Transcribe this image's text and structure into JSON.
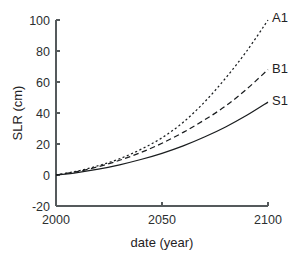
{
  "chart_data": {
    "type": "line",
    "title": "",
    "xlabel": "date (year)",
    "ylabel": "SLR (cm)",
    "xlim": [
      2000,
      2100
    ],
    "ylim": [
      -20,
      100
    ],
    "xticks": [
      2000,
      2050,
      2100
    ],
    "yticks": [
      -20,
      0,
      20,
      40,
      60,
      80,
      100
    ],
    "xtick_labels": [
      "2000",
      "2050",
      "2100"
    ],
    "ytick_labels": [
      "-20",
      "0",
      "20",
      "40",
      "60",
      "80",
      "100"
    ],
    "grid": false,
    "legend_position": "inline-right-end",
    "x": [
      2000,
      2010,
      2020,
      2030,
      2040,
      2050,
      2060,
      2070,
      2080,
      2090,
      2100
    ],
    "series": [
      {
        "name": "A1",
        "label": "A1",
        "style": "dotted",
        "color": "#1a1d1f",
        "values": [
          0,
          2.5,
          6.0,
          10.5,
          16.5,
          24.0,
          34.0,
          47.0,
          62.5,
          80.0,
          100.0
        ]
      },
      {
        "name": "B1",
        "label": "B1",
        "style": "dashed",
        "color": "#1a1d1f",
        "values": [
          0,
          2.2,
          5.4,
          9.5,
          14.5,
          20.5,
          27.5,
          35.5,
          44.5,
          55.5,
          68.0
        ]
      },
      {
        "name": "S1",
        "label": "S1",
        "style": "solid",
        "color": "#1a1d1f",
        "values": [
          0,
          1.6,
          3.8,
          6.6,
          10.0,
          14.0,
          18.8,
          24.5,
          31.0,
          38.5,
          47.0
        ]
      }
    ]
  },
  "geometry": {
    "plot_left": 56,
    "plot_right": 268,
    "plot_top": 20,
    "plot_bottom": 206,
    "tick_length": 4,
    "label_offsets": {
      "A1_dy": -2,
      "B1_dy": -1,
      "S1_dy": -1
    }
  }
}
